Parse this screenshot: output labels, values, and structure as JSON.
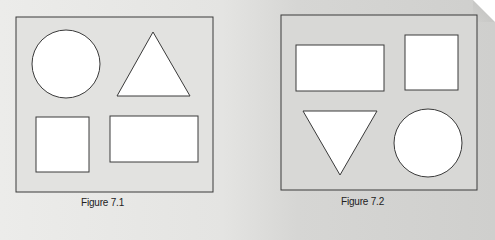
{
  "figures": [
    {
      "id": "figure-7-1",
      "caption": "Figure 7.1",
      "shapes": [
        {
          "type": "circle",
          "position": "top-left"
        },
        {
          "type": "triangle-up",
          "position": "top-right"
        },
        {
          "type": "square",
          "position": "bottom-left"
        },
        {
          "type": "rectangle",
          "position": "bottom-right"
        }
      ]
    },
    {
      "id": "figure-7-2",
      "caption": "Figure 7.2",
      "shapes": [
        {
          "type": "rectangle",
          "position": "top-left"
        },
        {
          "type": "square",
          "position": "top-right"
        },
        {
          "type": "triangle-down",
          "position": "bottom-left"
        },
        {
          "type": "circle",
          "position": "bottom-right"
        }
      ]
    }
  ],
  "colors": {
    "background": "#e4e4e2",
    "frame_fill": "#dcdcda",
    "shape_fill": "#ffffff",
    "stroke": "#3a3a3a"
  }
}
